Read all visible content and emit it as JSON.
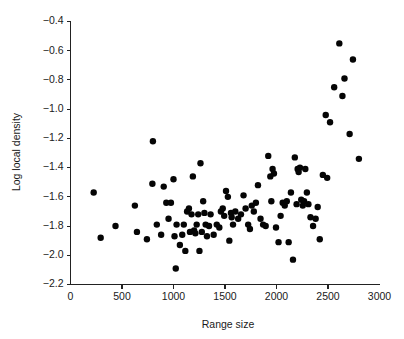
{
  "figure": {
    "background_color": "#ffffff",
    "point_color": "#050505",
    "axis_color": "#222222",
    "width": 404,
    "height": 339
  },
  "chart_data": {
    "type": "scatter",
    "title": "",
    "subtitle": "",
    "xlabel": "Range size",
    "ylabel": "Log local density",
    "xlim": [
      0,
      3000
    ],
    "ylim": [
      -2.2,
      -0.4
    ],
    "xticks": [
      0,
      500,
      1000,
      1500,
      2000,
      2500,
      3000
    ],
    "xtick_labels": [
      "0",
      "500",
      "1000",
      "1500",
      "2000",
      "2500",
      "3000"
    ],
    "yticks": [
      -0.4,
      -0.6,
      -0.8,
      -1.0,
      -1.2,
      -1.4,
      -1.6,
      -1.8,
      -2.0,
      -2.2
    ],
    "ytick_labels": [
      "−0.4",
      "−0.6",
      "−0.8",
      "−1.0",
      "−1.2",
      "−1.4",
      "−1.6",
      "−1.8",
      "−2.0",
      "−2.2"
    ],
    "grid": false,
    "legend": null,
    "legend_position": "none",
    "marker": "filled-circle",
    "marker_size_px": 3.2,
    "n_points": 105,
    "x": [
      225,
      293,
      437,
      625,
      645,
      742,
      795,
      800,
      838,
      880,
      905,
      930,
      952,
      975,
      1000,
      1010,
      1022,
      1030,
      1062,
      1085,
      1100,
      1115,
      1132,
      1150,
      1160,
      1175,
      1188,
      1200,
      1212,
      1225,
      1240,
      1252,
      1262,
      1275,
      1288,
      1300,
      1312,
      1325,
      1345,
      1360,
      1390,
      1420,
      1445,
      1460,
      1478,
      1492,
      1510,
      1528,
      1542,
      1558,
      1565,
      1578,
      1600,
      1628,
      1655,
      1680,
      1700,
      1725,
      1742,
      1760,
      1780,
      1800,
      1820,
      1845,
      1870,
      1895,
      1920,
      1940,
      1950,
      1962,
      1975,
      1995,
      2020,
      2040,
      2060,
      2080,
      2100,
      2118,
      2140,
      2160,
      2178,
      2195,
      2205,
      2215,
      2228,
      2240,
      2255,
      2268,
      2280,
      2295,
      2310,
      2330,
      2355,
      2380,
      2400,
      2420,
      2450,
      2478,
      2492,
      2520,
      2560,
      2610,
      2640,
      2660,
      2710,
      2742,
      2800
    ],
    "y": [
      -1.57,
      -1.88,
      -1.8,
      -1.66,
      -1.84,
      -1.89,
      -1.51,
      -1.22,
      -1.79,
      -1.86,
      -1.53,
      -1.64,
      -1.75,
      -1.64,
      -1.48,
      -1.87,
      -2.09,
      -1.79,
      -1.93,
      -1.86,
      -1.79,
      -1.97,
      -1.7,
      -1.68,
      -1.84,
      -1.72,
      -1.46,
      -1.83,
      -1.85,
      -1.79,
      -1.72,
      -1.97,
      -1.37,
      -1.84,
      -1.63,
      -1.71,
      -1.79,
      -1.87,
      -1.8,
      -1.72,
      -1.86,
      -1.79,
      -1.81,
      -1.7,
      -1.68,
      -1.73,
      -1.56,
      -1.6,
      -1.9,
      -1.71,
      -1.74,
      -1.79,
      -1.7,
      -1.75,
      -1.72,
      -1.59,
      -1.68,
      -1.79,
      -1.82,
      -1.66,
      -1.7,
      -1.64,
      -1.52,
      -1.75,
      -1.79,
      -1.8,
      -1.32,
      -1.46,
      -1.63,
      -1.41,
      -1.44,
      -1.81,
      -1.91,
      -1.73,
      -1.64,
      -1.66,
      -1.63,
      -1.91,
      -1.57,
      -2.03,
      -1.33,
      -1.65,
      -1.41,
      -1.43,
      -1.4,
      -1.62,
      -1.66,
      -1.63,
      -1.41,
      -1.57,
      -1.65,
      -1.74,
      -1.8,
      -1.75,
      -1.67,
      -1.89,
      -1.45,
      -1.04,
      -1.47,
      -1.09,
      -0.85,
      -0.55,
      -0.91,
      -0.79,
      -1.17,
      -0.66,
      -1.34
    ]
  }
}
